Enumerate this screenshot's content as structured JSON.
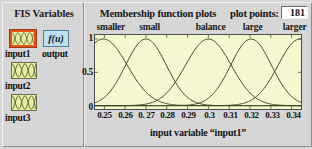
{
  "fis_panel": {
    "title": "FIS Variables",
    "variables": [
      {
        "name": "input1",
        "icon": "membership-curves-icon",
        "selected": true
      },
      {
        "name": "input2",
        "icon": "membership-curves-icon",
        "selected": false
      },
      {
        "name": "input3",
        "icon": "membership-curves-icon",
        "selected": false
      }
    ],
    "output": {
      "name": "output",
      "icon": "fu-icon",
      "label": "f(u)"
    }
  },
  "plot_panel": {
    "title": "Membership function plots",
    "plot_points_label": "plot points:",
    "plot_points_value": "181",
    "xlabel": "input variable  “input1”"
  },
  "colors": {
    "panel_background": "#d6d6d6",
    "axes_background": "#f4f7cf",
    "curve": "#3b4226",
    "selection": "#e8531a",
    "variable_icon": "#e9eda4",
    "output_icon": "#bfe0ef"
  },
  "chart_data": {
    "type": "line",
    "title": "Membership function plots",
    "xlabel": "input variable  “input1”",
    "ylabel": "",
    "xlim": [
      0.2455,
      0.3445
    ],
    "ylim": [
      -0.05,
      1.06
    ],
    "xticks": [
      "0.25",
      "0.26",
      "0. 27",
      "0.28",
      "0.29",
      "0.3",
      "0.31",
      "0.32",
      "0.33",
      "0.34"
    ],
    "xtick_values": [
      0.25,
      0.26,
      0.27,
      0.28,
      0.29,
      0.3,
      0.31,
      0.32,
      0.33,
      0.34
    ],
    "yticks": [
      "0",
      "0.5",
      "1"
    ],
    "ytick_values": [
      0,
      0.5,
      1
    ],
    "grid": false,
    "legend": "above-plot-labels",
    "series": [
      {
        "name": "smaller",
        "type": "gaussmf",
        "mean": 0.2495,
        "sigma": 0.0115,
        "label_x": 0.2535
      },
      {
        "name": "small",
        "type": "gaussmf",
        "mean": 0.27,
        "sigma": 0.0098,
        "label_x": 0.272
      },
      {
        "name": "balance",
        "type": "gaussmf",
        "mean": 0.3,
        "sigma": 0.011,
        "label_x": 0.301
      },
      {
        "name": "large",
        "type": "gaussmf",
        "mean": 0.3205,
        "sigma": 0.0098,
        "label_x": 0.321
      },
      {
        "name": "larger",
        "type": "gaussmf",
        "mean": 0.344,
        "sigma": 0.0105,
        "label_x": 0.341
      }
    ]
  }
}
